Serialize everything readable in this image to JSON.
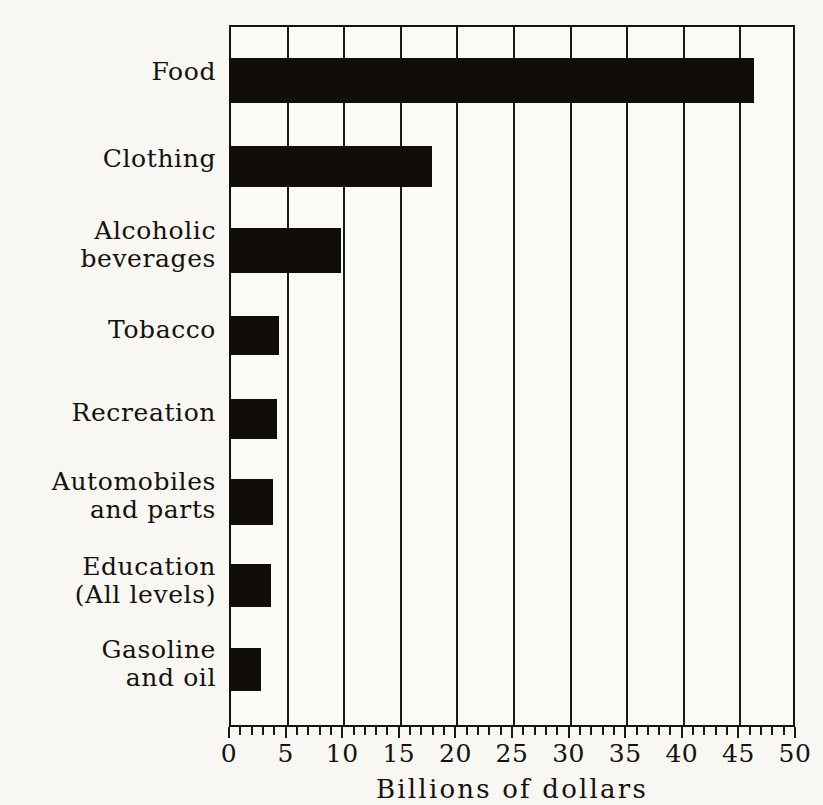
{
  "chart_data": {
    "type": "bar",
    "orientation": "horizontal",
    "title": "",
    "xlabel": "Billions of dollars",
    "ylabel": "",
    "xlim": [
      0,
      50
    ],
    "xticks": [
      0,
      5,
      10,
      15,
      20,
      25,
      30,
      35,
      40,
      45,
      50
    ],
    "xtick_labels": [
      "0",
      "5",
      "10",
      "15",
      "20",
      "25",
      "30",
      "35",
      "40",
      "45",
      "50"
    ],
    "minor_tick_interval": 1,
    "grid": "vertical-major-only",
    "legend": "none",
    "categories": [
      "Food",
      "Clothing",
      "Alcoholic\nbeverages",
      "Tobacco",
      "Recreation",
      "Automobiles\nand parts",
      "Education\n(All levels)",
      "Gasoline\nand oil"
    ],
    "values": [
      46.4,
      17.9,
      9.9,
      4.4,
      4.2,
      3.9,
      3.7,
      2.8
    ],
    "series": [
      {
        "name": "Consumer expenditures",
        "values": [
          46.4,
          17.9,
          9.9,
          4.4,
          4.2,
          3.9,
          3.7,
          2.8
        ]
      }
    ],
    "bar_color": "#100d0b",
    "background_color": "#f8f7f3"
  },
  "axis": {
    "title": "Billions of dollars",
    "tick_labels": [
      "0",
      "5",
      "10",
      "15",
      "20",
      "25",
      "30",
      "35",
      "40",
      "45",
      "50"
    ]
  },
  "categories": [
    {
      "label": "Food",
      "value": 46.4,
      "top": 33,
      "height": 45
    },
    {
      "label": "Clothing",
      "value": 17.9,
      "top": 121,
      "height": 41
    },
    {
      "label": "Alcoholic\nbeverages",
      "value": 9.9,
      "top": 203,
      "height": 45
    },
    {
      "label": "Tobacco",
      "value": 4.4,
      "top": 291,
      "height": 39
    },
    {
      "label": "Recreation",
      "value": 4.2,
      "top": 374,
      "height": 40
    },
    {
      "label": "Automobiles\nand parts",
      "value": 3.9,
      "top": 454,
      "height": 46
    },
    {
      "label": "Education\n(All levels)",
      "value": 3.7,
      "top": 539,
      "height": 43
    },
    {
      "label": "Gasoline\nand oil",
      "value": 2.8,
      "top": 623,
      "height": 43
    }
  ],
  "label_positions": [
    {
      "label": "Food",
      "top": 33,
      "lines": 1
    },
    {
      "label": "Clothing",
      "top": 120,
      "lines": 1
    },
    {
      "label": "Alcoholic\nbeverages",
      "top": 192,
      "lines": 2
    },
    {
      "label": "Tobacco",
      "top": 291,
      "lines": 1
    },
    {
      "label": "Recreation",
      "top": 374,
      "lines": 1
    },
    {
      "label": "Automobiles\nand parts",
      "top": 443,
      "lines": 2
    },
    {
      "label": "Education\n(All levels)",
      "top": 528,
      "lines": 2
    },
    {
      "label": "Gasoline\nand oil",
      "top": 611,
      "lines": 2
    }
  ],
  "colors": {
    "bar": "#100d0b",
    "axis": "#17140f",
    "text": "#14110f",
    "paper": "#f8f7f3",
    "plot_background": "#fbfaf6"
  }
}
